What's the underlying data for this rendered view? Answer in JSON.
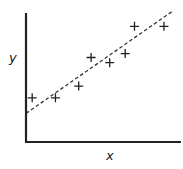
{
  "chart_data": {
    "type": "scatter",
    "title": "",
    "xlabel": "x",
    "ylabel": "y",
    "grid": false,
    "legend": null,
    "ticks": {
      "x": [],
      "y": []
    },
    "xlim": [
      0,
      100
    ],
    "ylim": [
      0,
      100
    ],
    "series": [
      {
        "name": "observations",
        "marker": "+",
        "points": [
          {
            "x": 4,
            "y": 34
          },
          {
            "x": 19,
            "y": 34
          },
          {
            "x": 34,
            "y": 43
          },
          {
            "x": 42,
            "y": 65
          },
          {
            "x": 54,
            "y": 61
          },
          {
            "x": 64,
            "y": 68
          },
          {
            "x": 70,
            "y": 89
          },
          {
            "x": 89,
            "y": 89
          }
        ]
      }
    ],
    "trendline": {
      "style": "dashed",
      "from": {
        "x": 0,
        "y": 22
      },
      "to": {
        "x": 95,
        "y": 101
      }
    }
  },
  "colors": {
    "axis": "#222222",
    "marker": "#222222",
    "trendline": "#333333",
    "background": "#ffffff"
  }
}
